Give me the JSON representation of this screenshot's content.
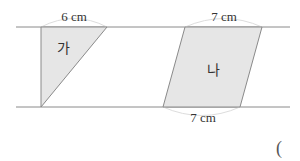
{
  "figure": {
    "colors": {
      "line": "#8a8a8a",
      "fill": "#e6e6e6",
      "arc": "#dddddd",
      "text": "#333333"
    },
    "parallel_lines": {
      "top_y": 27,
      "bottom_y": 107,
      "x_start": 16,
      "x_end": 290
    },
    "shapes": [
      {
        "id": "ga",
        "type": "triangle",
        "label": "가",
        "points": "41,27 107,27 41,107",
        "label_pos": {
          "x": 63,
          "y": 53
        },
        "dimension": {
          "text": "6 cm",
          "edge": "top",
          "x": 74,
          "y": 21
        }
      },
      {
        "id": "na",
        "type": "parallelogram",
        "label": "나",
        "points": "185,27 262,27 240,107 163,107",
        "label_pos": {
          "x": 213,
          "y": 75
        },
        "dimensions": [
          {
            "text": "7 cm",
            "edge": "top",
            "x": 224,
            "y": 21
          },
          {
            "text": "7 cm",
            "edge": "bottom",
            "x": 203,
            "y": 122
          }
        ]
      }
    ],
    "answer_paren": {
      "text": "(",
      "x": 279,
      "y": 154
    }
  }
}
